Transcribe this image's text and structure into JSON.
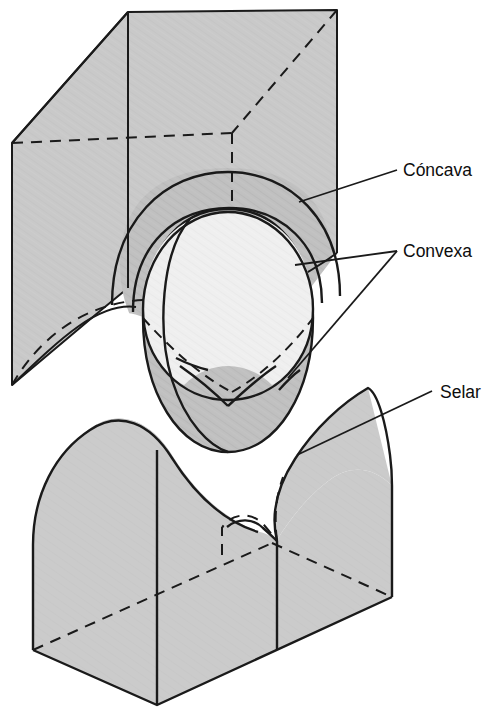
{
  "figure": {
    "background_color": "#ffffff",
    "stroke_color": "#1a1a1a",
    "fill_surface": "#c9c9c9",
    "fill_surface_dark": "#bdbdbd",
    "fill_sphere_light": "#efefef",
    "fill_saddle": "#cccccc",
    "fill_saddle_side": "#c4c4c4"
  },
  "labels": [
    {
      "id": "concava",
      "text": "Cóncava",
      "x": 403,
      "y": 176,
      "leaders": 1
    },
    {
      "id": "convexa",
      "text": "Convexa",
      "x": 403,
      "y": 257,
      "leaders": 2
    },
    {
      "id": "selar",
      "text": "Selar",
      "x": 440,
      "y": 398,
      "leaders": 1
    }
  ],
  "shapes": [
    {
      "id": "cube-block",
      "name": "Bloque cúbico con cavidad cóncava",
      "curvature": "cóncava"
    },
    {
      "id": "sphere",
      "name": "Esfera convexa interior",
      "curvature": "convexa"
    },
    {
      "id": "egg",
      "name": "Cuerpo ovoide convexo",
      "curvature": "convexa"
    },
    {
      "id": "saddle-block",
      "name": "Bloque con superficie selar",
      "curvature": "selar"
    }
  ]
}
